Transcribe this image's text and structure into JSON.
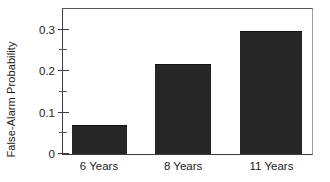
{
  "chart_data": {
    "type": "bar",
    "title": "",
    "subtitle": "",
    "xlabel": "",
    "ylabel": "False-Alarm Probability",
    "categories": [
      "6 Years",
      "8 Years",
      "11 Years"
    ],
    "values": [
      0.071,
      0.217,
      0.297
    ],
    "series": [
      {
        "name": "False-Alarm Probability",
        "values": [
          0.071,
          0.217,
          0.297
        ]
      }
    ],
    "ylim": [
      0,
      0.35
    ],
    "xlim": [
      0,
      3
    ],
    "y_major_ticks": [
      0,
      0.1,
      0.2,
      0.3
    ],
    "y_major_tick_labels": [
      "0",
      "0.1",
      "0.2",
      "0.3"
    ],
    "y_minor_ticks": [
      0.05,
      0.15,
      0.25
    ],
    "grid": false,
    "legend": null,
    "legend_position": "none",
    "annotations": [],
    "bar_color": "#262626",
    "axis_color": "#3a3e42",
    "background_color": "#ffffff",
    "frame": {
      "top": true,
      "right": true,
      "left": true,
      "bottom": true
    },
    "bar_geometry": [
      {
        "category": "6 Years",
        "left_pct": 3.6,
        "width_pct": 22.3,
        "value": 0.071
      },
      {
        "category": "8 Years",
        "left_pct": 37.1,
        "width_pct": 22.3,
        "value": 0.217
      },
      {
        "category": "11 Years",
        "left_pct": 70.9,
        "width_pct": 25.1,
        "value": 0.297
      }
    ]
  }
}
